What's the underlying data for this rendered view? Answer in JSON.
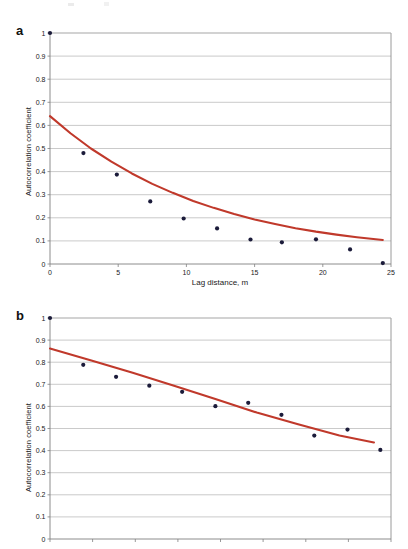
{
  "figure": {
    "background": "#ffffff",
    "series_color": "#C0392B",
    "marker_color": "#1b1b3a",
    "grid_color": "#b3b3b3",
    "axis_color": "#808080"
  },
  "panels": [
    {
      "letter": "a",
      "chart_data": {
        "type": "scatter",
        "title": "",
        "xlabel": "Lag distance, m",
        "ylabel": "Autocorrelation coefficient",
        "xlim": [
          0,
          25
        ],
        "ylim": [
          0,
          1
        ],
        "xticks": [
          0,
          5,
          10,
          15,
          20,
          25
        ],
        "xtick_labels": [
          "0",
          "5",
          "10",
          "15",
          "20",
          "25"
        ],
        "yticks": [
          0,
          0.1,
          0.2,
          0.3,
          0.4,
          0.5,
          0.6,
          0.7,
          0.8,
          0.9,
          1
        ],
        "ytick_labels": [
          "0",
          "0.1",
          "0.2",
          "0.3",
          "0.4",
          "0.5",
          "0.6",
          "0.7",
          "0.8",
          "0.9",
          "1"
        ],
        "grid": true,
        "legend": "none",
        "series": [
          {
            "name": "Observed autocorrelation",
            "style": "markers",
            "x": [
              0.0,
              2.45,
              4.9,
              7.35,
              9.8,
              12.25,
              14.7,
              17.0,
              19.5,
              22.0,
              24.4
            ],
            "y": [
              1.0,
              0.48,
              0.387,
              0.271,
              0.197,
              0.154,
              0.106,
              0.094,
              0.107,
              0.063,
              0.004
            ]
          },
          {
            "name": "Fitted exponential model",
            "style": "line",
            "x": [
              0.0,
              1.5,
              3.0,
              4.5,
              6.0,
              7.5,
              9.0,
              10.5,
              12.0,
              13.5,
              15.0,
              16.5,
              18.0,
              19.5,
              21.0,
              22.5,
              24.4
            ],
            "y": [
              0.64,
              0.566,
              0.5,
              0.443,
              0.392,
              0.347,
              0.308,
              0.273,
              0.243,
              0.216,
              0.193,
              0.173,
              0.155,
              0.14,
              0.127,
              0.116,
              0.104
            ]
          }
        ]
      }
    },
    {
      "letter": "b",
      "chart_data": {
        "type": "scatter",
        "title": "",
        "xlabel": "",
        "ylabel": "Autocorrelation coefficient",
        "xlim": [
          0,
          8
        ],
        "ylim": [
          0,
          1
        ],
        "xticks": [
          0,
          1,
          2,
          3,
          4,
          5,
          6,
          7,
          8
        ],
        "xtick_labels": [
          "",
          "",
          "",
          "",
          "",
          "",
          "",
          "",
          ""
        ],
        "yticks": [
          0,
          0.1,
          0.2,
          0.3,
          0.4,
          0.5,
          0.6,
          0.7,
          0.8,
          0.9,
          1
        ],
        "ytick_labels": [
          "0",
          "0.1",
          "0.2",
          "0.3",
          "0.4",
          "0.5",
          "0.6",
          "0.7",
          "0.8",
          "0.9",
          "1"
        ],
        "grid": true,
        "legend": "none",
        "note": "x-axis tick labels and axis title are cropped off the bottom of the screenshot",
        "series": [
          {
            "name": "Observed autocorrelation",
            "style": "markers",
            "x": [
              0.0,
              0.78,
              1.55,
              2.33,
              3.1,
              3.88,
              4.65,
              5.43,
              6.2,
              6.98,
              7.75
            ],
            "y": [
              1.0,
              0.788,
              0.734,
              0.694,
              0.666,
              0.601,
              0.616,
              0.562,
              0.468,
              0.495,
              0.403
            ]
          },
          {
            "name": "Fitted model",
            "style": "line",
            "x": [
              0.0,
              0.97,
              1.94,
              2.91,
              3.88,
              4.85,
              5.82,
              6.79,
              7.6
            ],
            "y": [
              0.862,
              0.808,
              0.752,
              0.694,
              0.633,
              0.572,
              0.519,
              0.468,
              0.437
            ]
          }
        ]
      }
    }
  ]
}
